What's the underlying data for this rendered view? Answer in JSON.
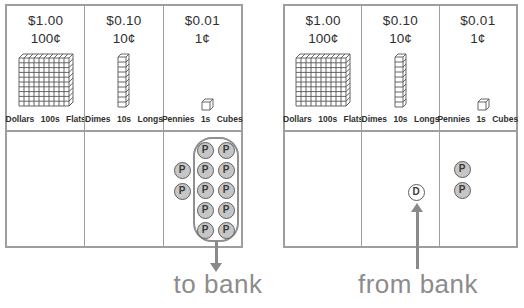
{
  "colors": {
    "border_gray": "#9e9e9e",
    "text_dark": "#2f2f2f",
    "label_gray": "#8c8c8c",
    "coin_fill": "#c6c6c6",
    "coin_stroke": "#5f5f5f",
    "loop_stroke": "#8f8f8f",
    "arrow_gray": "#8a8a8a",
    "block_stroke": "#555555"
  },
  "panels": [
    {
      "name": "left-chart",
      "columns": [
        {
          "amount": "$1.00",
          "cents": "100¢",
          "label": "Dollars 100s Flats",
          "block": "flat"
        },
        {
          "amount": "$0.10",
          "cents": "10¢",
          "label": "Dimes 10s Longs",
          "block": "long"
        },
        {
          "amount": "$0.01",
          "cents": "1¢",
          "label": "Pennies 1s Cubes",
          "block": "cube"
        }
      ],
      "arrow_label": "to bank",
      "arrow_direction": "down"
    },
    {
      "name": "right-chart",
      "columns": [
        {
          "amount": "$1.00",
          "cents": "100¢",
          "label": "Dollars 100s Flats",
          "block": "flat"
        },
        {
          "amount": "$0.10",
          "cents": "10¢",
          "label": "Dimes 10s Longs",
          "block": "long"
        },
        {
          "amount": "$0.01",
          "cents": "1¢",
          "label": "Pennies 1s Cubes",
          "block": "cube"
        }
      ],
      "arrow_label": "from bank",
      "arrow_direction": "up"
    }
  ],
  "coins": {
    "penny_letter": "P",
    "dime_letter": "D",
    "group_of_ten_circled": true,
    "items": [
      {
        "type": "penny",
        "letter": "P",
        "x": 205,
        "y": 150,
        "grouped": true
      },
      {
        "type": "penny",
        "letter": "P",
        "x": 226,
        "y": 150,
        "grouped": true
      },
      {
        "type": "penny",
        "letter": "P",
        "x": 205,
        "y": 170,
        "grouped": true
      },
      {
        "type": "penny",
        "letter": "P",
        "x": 226,
        "y": 170,
        "grouped": true
      },
      {
        "type": "penny",
        "letter": "P",
        "x": 205,
        "y": 190,
        "grouped": true
      },
      {
        "type": "penny",
        "letter": "P",
        "x": 226,
        "y": 190,
        "grouped": true
      },
      {
        "type": "penny",
        "letter": "P",
        "x": 205,
        "y": 210,
        "grouped": true
      },
      {
        "type": "penny",
        "letter": "P",
        "x": 226,
        "y": 210,
        "grouped": true
      },
      {
        "type": "penny",
        "letter": "P",
        "x": 205,
        "y": 230,
        "grouped": true
      },
      {
        "type": "penny",
        "letter": "P",
        "x": 226,
        "y": 230,
        "grouped": true
      },
      {
        "type": "penny",
        "letter": "P",
        "x": 182,
        "y": 170,
        "grouped": false
      },
      {
        "type": "penny",
        "letter": "P",
        "x": 182,
        "y": 191,
        "grouped": false
      },
      {
        "type": "dime",
        "letter": "D",
        "x": 416,
        "y": 192,
        "grouped": false
      },
      {
        "type": "penny",
        "letter": "P",
        "x": 462,
        "y": 169,
        "grouped": false
      },
      {
        "type": "penny",
        "letter": "P",
        "x": 462,
        "y": 190,
        "grouped": false
      }
    ]
  }
}
